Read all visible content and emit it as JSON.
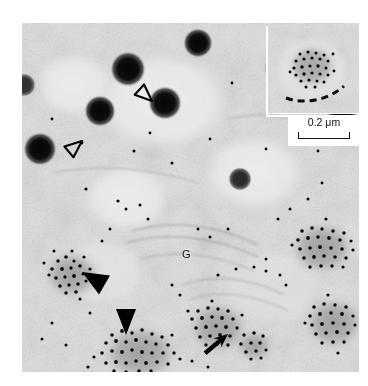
{
  "figure": {
    "panel_label": "(a)",
    "type": "immunogold-electron-micrograph"
  },
  "annotations": {
    "golgi_label": "G",
    "open_arrowheads": [
      {
        "name": "open-arrowhead-1",
        "x": 152,
        "y": 101,
        "rotation": 42
      },
      {
        "name": "open-arrowhead-2",
        "x": 82,
        "y": 141,
        "rotation": -40
      }
    ],
    "filled_arrowheads": [
      {
        "name": "filled-arrowhead-1",
        "x": 82,
        "y": 272,
        "rotation": -125
      },
      {
        "name": "filled-arrowhead-2",
        "x": 126,
        "y": 312,
        "rotation": 180
      }
    ],
    "arrows": [
      {
        "name": "arrow-1",
        "x": 228,
        "y": 334,
        "rotation": -44
      }
    ]
  },
  "inset": {
    "present": true,
    "dashed_curve": true,
    "scalebar": {
      "value": "0.2",
      "unit": "μm",
      "label": "0.2 μm"
    }
  },
  "colors": {
    "background": "#ffffff",
    "micrograph_base": "#d9d9d9",
    "gold_particle": "#0a0a0a",
    "dark_granule": "#0f0f0f",
    "annotation_ink": "#000000"
  }
}
